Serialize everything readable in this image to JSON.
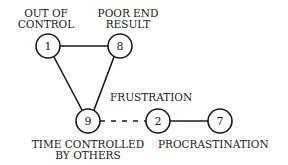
{
  "diagram": {
    "nodes": [
      {
        "id": "1",
        "label_lines": [
          "OUT OF",
          "CONTROL"
        ]
      },
      {
        "id": "8",
        "label_lines": [
          "POOR END",
          "RESULT"
        ]
      },
      {
        "id": "9",
        "label_lines": [
          "TIME CONTROLLED",
          "BY OTHERS"
        ]
      },
      {
        "id": "2",
        "label_lines": [
          "FRUSTRATION"
        ]
      },
      {
        "id": "7",
        "label_lines": [
          "PROCRASTINATION"
        ]
      }
    ],
    "edges": [
      {
        "from": "1",
        "to": "8",
        "style": "solid"
      },
      {
        "from": "1",
        "to": "9",
        "style": "solid"
      },
      {
        "from": "8",
        "to": "9",
        "style": "solid"
      },
      {
        "from": "9",
        "to": "2",
        "style": "dashed"
      },
      {
        "from": "2",
        "to": "7",
        "style": "solid"
      }
    ]
  }
}
